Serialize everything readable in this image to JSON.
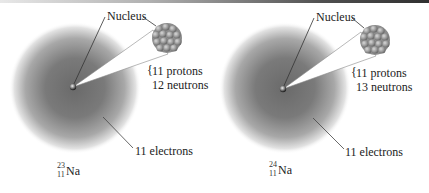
{
  "figure": {
    "atoms": [
      {
        "id": "sodium-23",
        "nucleus_label": "Nucleus",
        "protons_label": "11 protons",
        "neutrons_label": "12 neutrons",
        "electrons_label": "11 electrons",
        "isotope": {
          "mass_number": "23",
          "atomic_number": "11",
          "symbol": "Na"
        }
      },
      {
        "id": "sodium-24",
        "nucleus_label": "Nucleus",
        "protons_label": "11 protons",
        "neutrons_label": "13 neutrons",
        "electrons_label": "11 electrons",
        "isotope": {
          "mass_number": "24",
          "atomic_number": "11",
          "symbol": "Na"
        }
      }
    ],
    "colors": {
      "cloud_core": "#6f6f6f",
      "cloud_edge": "#ffffff",
      "nucleon": "#9a9a9a",
      "leader_line": "#333333",
      "wedge_fill": "#ffffff"
    }
  }
}
